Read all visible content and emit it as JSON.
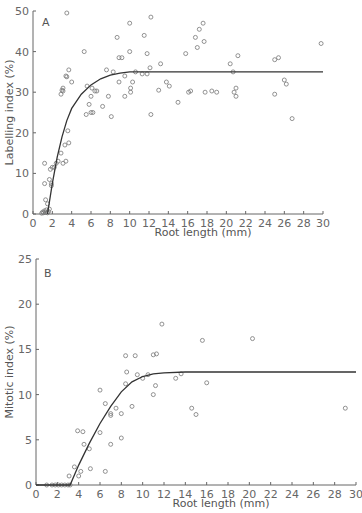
{
  "chart_data": [
    {
      "type": "scatter",
      "panel_label": "A",
      "title": "",
      "xlabel": "Root length (mm)",
      "ylabel": "Labelling index (%)",
      "xlim": [
        0,
        30
      ],
      "ylim": [
        0,
        50
      ],
      "xticks": [
        0,
        2,
        4,
        6,
        8,
        10,
        12,
        14,
        16,
        18,
        20,
        22,
        24,
        26,
        28,
        30
      ],
      "yticks": [
        0,
        10,
        20,
        30,
        40,
        50
      ],
      "grid": false,
      "legend": null,
      "series": [
        {
          "name": "observations",
          "marker": "open-circle",
          "points": [
            [
              0.9,
              0.2
            ],
            [
              1.0,
              0.5
            ],
            [
              1.1,
              0.3
            ],
            [
              1.2,
              0.8
            ],
            [
              1.3,
              0.4
            ],
            [
              1.4,
              1.0
            ],
            [
              1.5,
              0.3
            ],
            [
              1.5,
              2.5
            ],
            [
              1.6,
              0.6
            ],
            [
              1.3,
              3.5
            ],
            [
              1.7,
              1.2
            ],
            [
              1.2,
              12.5
            ],
            [
              1.2,
              7.5
            ],
            [
              1.8,
              11
            ],
            [
              1.7,
              8.5
            ],
            [
              1.9,
              7.5
            ],
            [
              1.9,
              7
            ],
            [
              2.0,
              11.5
            ],
            [
              2.2,
              11.5
            ],
            [
              2.4,
              12.5
            ],
            [
              2.6,
              13
            ],
            [
              2.9,
              15
            ],
            [
              3.1,
              12.5
            ],
            [
              3.3,
              17
            ],
            [
              3.4,
              13
            ],
            [
              3.6,
              20.5
            ],
            [
              3.7,
              17.5
            ],
            [
              2.9,
              29.5
            ],
            [
              3.0,
              30.5
            ],
            [
              3.1,
              31
            ],
            [
              3.1,
              30.3
            ],
            [
              3.4,
              34
            ],
            [
              3.5,
              33.8
            ],
            [
              3.7,
              35.5
            ],
            [
              4.0,
              32.5
            ],
            [
              3.5,
              49.5
            ],
            [
              5.3,
              40
            ],
            [
              5.5,
              24.5
            ],
            [
              5.8,
              27
            ],
            [
              6.0,
              25
            ],
            [
              6.2,
              25
            ],
            [
              5.6,
              31.5
            ],
            [
              6.0,
              29
            ],
            [
              6.1,
              31
            ],
            [
              6.4,
              30.3
            ],
            [
              6.6,
              30.3
            ],
            [
              7.2,
              26.5
            ],
            [
              7.6,
              35.5
            ],
            [
              7.8,
              29
            ],
            [
              8.1,
              24
            ],
            [
              8.3,
              35
            ],
            [
              8.7,
              43.5
            ],
            [
              8.9,
              38.5
            ],
            [
              9.2,
              38.5
            ],
            [
              8.9,
              32.5
            ],
            [
              9.5,
              34
            ],
            [
              9.5,
              29
            ],
            [
              10.0,
              47
            ],
            [
              10.0,
              40
            ],
            [
              10.1,
              31
            ],
            [
              10.1,
              30
            ],
            [
              10.3,
              32.5
            ],
            [
              10.6,
              35
            ],
            [
              11.3,
              34.5
            ],
            [
              11.8,
              34.5
            ],
            [
              11.5,
              44
            ],
            [
              11.8,
              39.5
            ],
            [
              12.2,
              48.5
            ],
            [
              12.1,
              36
            ],
            [
              12.2,
              24.5
            ],
            [
              13.0,
              30.5
            ],
            [
              13.2,
              37
            ],
            [
              13.8,
              32.5
            ],
            [
              14.1,
              31.5
            ],
            [
              15.0,
              27.5
            ],
            [
              15.8,
              39.5
            ],
            [
              16.1,
              30
            ],
            [
              16.3,
              30.3
            ],
            [
              16.8,
              43.5
            ],
            [
              17.2,
              45.5
            ],
            [
              17.0,
              41
            ],
            [
              17.6,
              47
            ],
            [
              17.7,
              42.5
            ],
            [
              17.8,
              30
            ],
            [
              18.5,
              30.3
            ],
            [
              19.0,
              30
            ],
            [
              20.4,
              37
            ],
            [
              20.7,
              35
            ],
            [
              20.8,
              30
            ],
            [
              21.0,
              31
            ],
            [
              21.2,
              39
            ],
            [
              21.0,
              29
            ],
            [
              25.0,
              29.5
            ],
            [
              25.0,
              38
            ],
            [
              25.4,
              38.5
            ],
            [
              26.0,
              33
            ],
            [
              26.2,
              32
            ],
            [
              26.8,
              23.5
            ],
            [
              29.8,
              42
            ]
          ]
        },
        {
          "name": "fitted curve",
          "style": "line",
          "points": [
            [
              1.5,
              0
            ],
            [
              2,
              7.5
            ],
            [
              2.5,
              14
            ],
            [
              3,
              19
            ],
            [
              3.5,
              23
            ],
            [
              4,
              26
            ],
            [
              5,
              29.5
            ],
            [
              6,
              31.8
            ],
            [
              7,
              33.3
            ],
            [
              8,
              34.2
            ],
            [
              9,
              34.7
            ],
            [
              10,
              35
            ],
            [
              12,
              35
            ],
            [
              16,
              35
            ],
            [
              20,
              35
            ],
            [
              25,
              35
            ],
            [
              30,
              35
            ]
          ]
        }
      ]
    },
    {
      "type": "scatter",
      "panel_label": "B",
      "title": "",
      "xlabel": "Root length (mm)",
      "ylabel": "Mitotic index (%)",
      "xlim": [
        0,
        30
      ],
      "ylim": [
        0,
        25
      ],
      "xticks": [
        0,
        2,
        4,
        6,
        8,
        10,
        12,
        14,
        16,
        18,
        20,
        22,
        24,
        26,
        28,
        30
      ],
      "yticks": [
        0,
        5,
        10,
        15,
        20,
        25
      ],
      "grid": false,
      "legend": null,
      "series": [
        {
          "name": "observations",
          "marker": "open-circle",
          "points": [
            [
              1.0,
              0
            ],
            [
              1.5,
              0
            ],
            [
              1.8,
              0
            ],
            [
              2.1,
              0
            ],
            [
              2.4,
              0
            ],
            [
              2.7,
              0
            ],
            [
              3.0,
              0
            ],
            [
              3.2,
              0
            ],
            [
              3.1,
              1
            ],
            [
              3.6,
              2
            ],
            [
              4.0,
              1
            ],
            [
              4.2,
              1.5
            ],
            [
              3.9,
              6
            ],
            [
              4.4,
              5.9
            ],
            [
              4.5,
              4.5
            ],
            [
              5.0,
              4
            ],
            [
              5.1,
              1.8
            ],
            [
              6.0,
              10.5
            ],
            [
              6.0,
              5.8
            ],
            [
              6.5,
              9
            ],
            [
              6.5,
              1.5
            ],
            [
              7.0,
              7.9
            ],
            [
              7.0,
              7.7
            ],
            [
              7.0,
              4.5
            ],
            [
              7.5,
              8.5
            ],
            [
              8.0,
              5.2
            ],
            [
              8.0,
              7.9
            ],
            [
              8.4,
              14.3
            ],
            [
              8.4,
              11.2
            ],
            [
              8.5,
              12.5
            ],
            [
              9.0,
              8.7
            ],
            [
              9.5,
              12.2
            ],
            [
              9.3,
              14.3
            ],
            [
              10.0,
              11.8
            ],
            [
              10.5,
              12.2
            ],
            [
              11.0,
              10
            ],
            [
              11.2,
              11
            ],
            [
              11.0,
              14.4
            ],
            [
              11.3,
              14.5
            ],
            [
              11.8,
              17.8
            ],
            [
              13.1,
              11.8
            ],
            [
              13.6,
              12.3
            ],
            [
              14.6,
              8.5
            ],
            [
              15.0,
              7.8
            ],
            [
              15.6,
              16
            ],
            [
              16.0,
              11.3
            ],
            [
              20.3,
              16.2
            ],
            [
              29.0,
              8.5
            ]
          ]
        },
        {
          "name": "fitted curve",
          "style": "line",
          "points": [
            [
              0,
              0
            ],
            [
              3.2,
              0
            ],
            [
              4,
              2.2
            ],
            [
              5,
              4.6
            ],
            [
              6,
              6.8
            ],
            [
              7,
              8.7
            ],
            [
              8,
              10.3
            ],
            [
              9,
              11.4
            ],
            [
              10,
              12
            ],
            [
              11,
              12.3
            ],
            [
              12,
              12.4
            ],
            [
              14,
              12.5
            ],
            [
              20,
              12.5
            ],
            [
              30,
              12.5
            ]
          ]
        }
      ]
    }
  ]
}
